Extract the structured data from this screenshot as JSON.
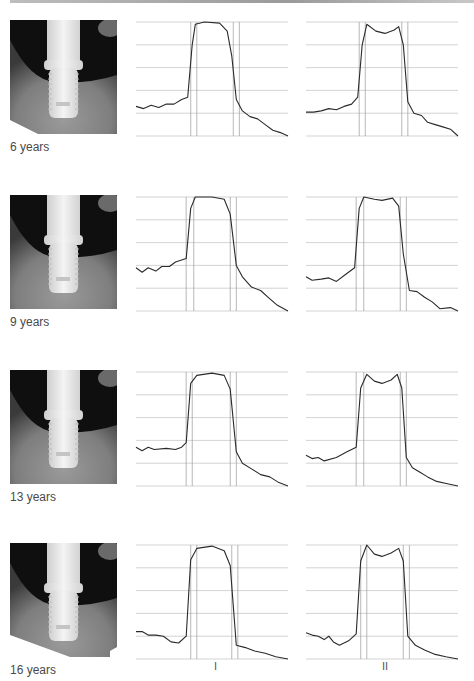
{
  "figure": {
    "rows": [
      {
        "label": "6 years",
        "profile_I": [
          [
            0,
            0.26
          ],
          [
            0.05,
            0.24
          ],
          [
            0.1,
            0.27
          ],
          [
            0.15,
            0.25
          ],
          [
            0.2,
            0.28
          ],
          [
            0.25,
            0.28
          ],
          [
            0.3,
            0.32
          ],
          [
            0.34,
            0.34
          ],
          [
            0.37,
            0.8
          ],
          [
            0.39,
            0.98
          ],
          [
            0.45,
            1.0
          ],
          [
            0.55,
            0.99
          ],
          [
            0.6,
            0.92
          ],
          [
            0.63,
            0.7
          ],
          [
            0.66,
            0.32
          ],
          [
            0.7,
            0.22
          ],
          [
            0.75,
            0.17
          ],
          [
            0.8,
            0.15
          ],
          [
            0.85,
            0.1
          ],
          [
            0.9,
            0.05
          ],
          [
            0.95,
            0.03
          ],
          [
            1,
            0
          ]
        ],
        "profile_II": [
          [
            0,
            0.21
          ],
          [
            0.05,
            0.21
          ],
          [
            0.1,
            0.22
          ],
          [
            0.15,
            0.24
          ],
          [
            0.2,
            0.23
          ],
          [
            0.25,
            0.26
          ],
          [
            0.3,
            0.28
          ],
          [
            0.34,
            0.34
          ],
          [
            0.37,
            0.8
          ],
          [
            0.4,
            0.98
          ],
          [
            0.46,
            0.92
          ],
          [
            0.52,
            0.9
          ],
          [
            0.58,
            0.93
          ],
          [
            0.61,
            0.96
          ],
          [
            0.64,
            0.8
          ],
          [
            0.67,
            0.3
          ],
          [
            0.71,
            0.2
          ],
          [
            0.76,
            0.18
          ],
          [
            0.8,
            0.12
          ],
          [
            0.85,
            0.1
          ],
          [
            0.9,
            0.08
          ],
          [
            0.95,
            0.06
          ],
          [
            1,
            0
          ]
        ],
        "bounds_I": [
          0.36,
          0.4,
          0.64,
          0.68
        ],
        "bounds_II": [
          0.35,
          0.39,
          0.63,
          0.67
        ]
      },
      {
        "label": "9 years",
        "profile_I": [
          [
            0,
            0.38
          ],
          [
            0.04,
            0.34
          ],
          [
            0.08,
            0.38
          ],
          [
            0.13,
            0.35
          ],
          [
            0.17,
            0.39
          ],
          [
            0.22,
            0.39
          ],
          [
            0.26,
            0.43
          ],
          [
            0.33,
            0.46
          ],
          [
            0.36,
            0.9
          ],
          [
            0.39,
            1.0
          ],
          [
            0.5,
            1.0
          ],
          [
            0.58,
            0.98
          ],
          [
            0.62,
            0.85
          ],
          [
            0.66,
            0.4
          ],
          [
            0.7,
            0.3
          ],
          [
            0.76,
            0.21
          ],
          [
            0.82,
            0.18
          ],
          [
            0.87,
            0.12
          ],
          [
            0.93,
            0.05
          ],
          [
            1,
            0
          ]
        ],
        "profile_II": [
          [
            0,
            0.3
          ],
          [
            0.04,
            0.27
          ],
          [
            0.1,
            0.28
          ],
          [
            0.15,
            0.29
          ],
          [
            0.2,
            0.26
          ],
          [
            0.26,
            0.32
          ],
          [
            0.32,
            0.38
          ],
          [
            0.35,
            0.9
          ],
          [
            0.38,
            1.0
          ],
          [
            0.45,
            0.98
          ],
          [
            0.5,
            0.97
          ],
          [
            0.57,
            0.99
          ],
          [
            0.61,
            0.92
          ],
          [
            0.64,
            0.5
          ],
          [
            0.68,
            0.18
          ],
          [
            0.73,
            0.17
          ],
          [
            0.78,
            0.12
          ],
          [
            0.83,
            0.08
          ],
          [
            0.88,
            0.02
          ],
          [
            0.95,
            0.03
          ],
          [
            1,
            0
          ]
        ],
        "bounds_I": [
          0.33,
          0.38,
          0.62,
          0.66
        ],
        "bounds_II": [
          0.33,
          0.38,
          0.62,
          0.66
        ]
      },
      {
        "label": "13 years",
        "profile_I": [
          [
            0,
            0.34
          ],
          [
            0.04,
            0.31
          ],
          [
            0.08,
            0.34
          ],
          [
            0.12,
            0.32
          ],
          [
            0.2,
            0.33
          ],
          [
            0.26,
            0.32
          ],
          [
            0.3,
            0.34
          ],
          [
            0.33,
            0.38
          ],
          [
            0.36,
            0.9
          ],
          [
            0.4,
            0.97
          ],
          [
            0.5,
            0.99
          ],
          [
            0.58,
            0.97
          ],
          [
            0.62,
            0.85
          ],
          [
            0.66,
            0.3
          ],
          [
            0.7,
            0.2
          ],
          [
            0.76,
            0.15
          ],
          [
            0.82,
            0.1
          ],
          [
            0.88,
            0.08
          ],
          [
            0.94,
            0.03
          ],
          [
            1,
            0
          ]
        ],
        "profile_II": [
          [
            0,
            0.27
          ],
          [
            0.04,
            0.24
          ],
          [
            0.08,
            0.25
          ],
          [
            0.12,
            0.22
          ],
          [
            0.2,
            0.25
          ],
          [
            0.27,
            0.3
          ],
          [
            0.33,
            0.34
          ],
          [
            0.36,
            0.86
          ],
          [
            0.4,
            0.98
          ],
          [
            0.45,
            0.92
          ],
          [
            0.5,
            0.9
          ],
          [
            0.56,
            0.93
          ],
          [
            0.6,
            0.98
          ],
          [
            0.63,
            0.86
          ],
          [
            0.66,
            0.25
          ],
          [
            0.7,
            0.16
          ],
          [
            0.75,
            0.12
          ],
          [
            0.8,
            0.08
          ],
          [
            0.86,
            0.04
          ],
          [
            0.93,
            0.02
          ],
          [
            1,
            0
          ]
        ],
        "bounds_I": [
          0.33,
          0.37,
          0.62,
          0.66
        ],
        "bounds_II": [
          0.33,
          0.38,
          0.62,
          0.66
        ]
      },
      {
        "label": "16 years",
        "profile_I": [
          [
            0,
            0.24
          ],
          [
            0.04,
            0.24
          ],
          [
            0.08,
            0.21
          ],
          [
            0.13,
            0.21
          ],
          [
            0.18,
            0.2
          ],
          [
            0.23,
            0.15
          ],
          [
            0.28,
            0.14
          ],
          [
            0.33,
            0.2
          ],
          [
            0.36,
            0.87
          ],
          [
            0.4,
            0.97
          ],
          [
            0.5,
            0.99
          ],
          [
            0.58,
            0.95
          ],
          [
            0.62,
            0.82
          ],
          [
            0.66,
            0.12
          ],
          [
            0.72,
            0.1
          ],
          [
            0.78,
            0.07
          ],
          [
            0.85,
            0.05
          ],
          [
            0.92,
            0.02
          ],
          [
            1,
            0
          ]
        ],
        "profile_II": [
          [
            0,
            0.23
          ],
          [
            0.04,
            0.21
          ],
          [
            0.08,
            0.2
          ],
          [
            0.12,
            0.17
          ],
          [
            0.15,
            0.2
          ],
          [
            0.18,
            0.15
          ],
          [
            0.22,
            0.12
          ],
          [
            0.28,
            0.16
          ],
          [
            0.33,
            0.22
          ],
          [
            0.36,
            0.86
          ],
          [
            0.4,
            1.0
          ],
          [
            0.45,
            0.92
          ],
          [
            0.5,
            0.9
          ],
          [
            0.56,
            0.93
          ],
          [
            0.61,
            0.97
          ],
          [
            0.64,
            0.86
          ],
          [
            0.67,
            0.2
          ],
          [
            0.72,
            0.12
          ],
          [
            0.78,
            0.08
          ],
          [
            0.85,
            0.04
          ],
          [
            0.92,
            0.02
          ],
          [
            1,
            0
          ]
        ],
        "bounds_I": [
          0.36,
          0.4,
          0.63,
          0.67
        ],
        "bounds_II": [
          0.36,
          0.4,
          0.64,
          0.68
        ]
      }
    ],
    "column_labels": {
      "I": "I",
      "II": "II"
    },
    "colors": {
      "curve": "#2a2a2a",
      "grid": "#c8c8c8",
      "bound": "#9a9a9a"
    }
  },
  "chart_data": [
    {
      "type": "line",
      "title": "6 years – profile I",
      "grid": true,
      "ylim": [
        0,
        1
      ]
    },
    {
      "type": "line",
      "title": "6 years – profile II",
      "grid": true,
      "ylim": [
        0,
        1
      ]
    },
    {
      "type": "line",
      "title": "9 years – profile I",
      "grid": true,
      "ylim": [
        0,
        1
      ]
    },
    {
      "type": "line",
      "title": "9 years – profile II",
      "grid": true,
      "ylim": [
        0,
        1
      ]
    },
    {
      "type": "line",
      "title": "13 years – profile I",
      "grid": true,
      "ylim": [
        0,
        1
      ]
    },
    {
      "type": "line",
      "title": "13 years – profile II",
      "grid": true,
      "ylim": [
        0,
        1
      ]
    },
    {
      "type": "line",
      "title": "16 years – profile I",
      "grid": true,
      "ylim": [
        0,
        1
      ]
    },
    {
      "type": "line",
      "title": "16 years – profile II",
      "grid": true,
      "ylim": [
        0,
        1
      ]
    }
  ]
}
